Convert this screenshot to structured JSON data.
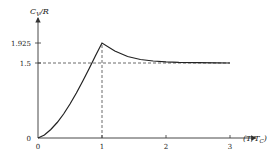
{
  "chart_data": {
    "type": "line",
    "title": "",
    "xlabel": "(T/T_C)",
    "ylabel": "C_V/R",
    "xlim": [
      0,
      3.4
    ],
    "ylim": [
      0,
      2.4
    ],
    "x_ticks": [
      0,
      1,
      2,
      3
    ],
    "x_tick_labels": [
      "0",
      "1",
      "2",
      "3"
    ],
    "y_ticks": [
      0,
      1.5,
      1.925
    ],
    "y_tick_labels": [
      "0",
      "1.5",
      "1.925"
    ],
    "grid": false,
    "legend": "none",
    "series": [
      {
        "name": "heat capacity",
        "x": [
          0,
          0.1,
          0.2,
          0.3,
          0.4,
          0.5,
          0.6,
          0.7,
          0.8,
          0.9,
          1.0,
          1.2,
          1.4,
          1.6,
          1.8,
          2.0,
          2.2,
          2.5,
          2.8,
          3.0
        ],
        "y": [
          0,
          0.06,
          0.17,
          0.31,
          0.48,
          0.68,
          0.9,
          1.14,
          1.39,
          1.65,
          1.925,
          1.74,
          1.63,
          1.57,
          1.54,
          1.525,
          1.515,
          1.508,
          1.503,
          1.5
        ]
      }
    ],
    "reference_lines": [
      {
        "orientation": "horizontal",
        "y": 1.5,
        "style": "dashed",
        "x_extent": [
          0,
          3
        ]
      },
      {
        "orientation": "vertical",
        "x": 1,
        "style": "dashed",
        "y_extent": [
          0,
          1.925
        ]
      }
    ],
    "annotations": [
      {
        "text": "1.925",
        "at": "y-axis"
      },
      {
        "text": "1.5",
        "at": "y-axis"
      }
    ]
  }
}
